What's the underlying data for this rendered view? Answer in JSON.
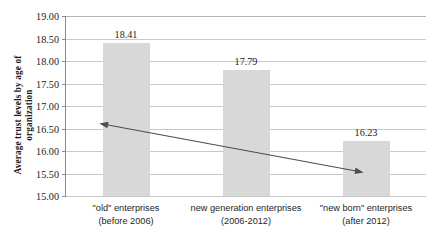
{
  "chart_data": {
    "type": "bar",
    "title": "",
    "xlabel": "",
    "ylabel": "Average trust levels by age of organization",
    "ylabel_lines": [
      "Average trust levels by age of",
      "organization"
    ],
    "categories": [
      "\"old\" enterprises (before 2006)",
      "new generation enterprises (2006-2012)",
      "\"new born\" enterprises (after 2012)"
    ],
    "category_lines": [
      [
        "\"old\" enterprises",
        "(before 2006)"
      ],
      [
        "new generation enterprises",
        "(2006-2012)"
      ],
      [
        "\"new born\" enterprises",
        "(after 2012)"
      ]
    ],
    "values": [
      18.41,
      17.79,
      16.23
    ],
    "value_labels": [
      "18.41",
      "17.79",
      "16.23"
    ],
    "ylim": [
      15.0,
      19.0
    ],
    "ytick_labels": [
      "19.00",
      "18.50",
      "18.00",
      "17.50",
      "17.00",
      "16.50",
      "16.00",
      "15.50",
      "15.00"
    ],
    "ytick_values": [
      19.0,
      18.5,
      18.0,
      17.5,
      17.0,
      16.5,
      16.0,
      15.5,
      15.0
    ],
    "grid": true,
    "legend": false,
    "bar_color": "#d8d8d8",
    "gridline_color": "#c8c8c8",
    "axis_color": "#8c8c8c",
    "text_color": "#1a1a1a",
    "annotations": [
      {
        "name": "declining-trend-arrow",
        "type": "double-headed-arrow",
        "color": "#4d4d4d",
        "from": {
          "x": 108,
          "y": 125
        },
        "to": {
          "x": 356,
          "y": 171
        }
      }
    ]
  }
}
